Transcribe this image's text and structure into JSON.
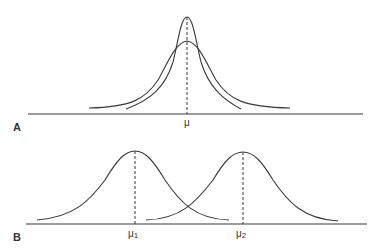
{
  "panels": {
    "A": {
      "label": "A",
      "mean_label": "μ",
      "description": "Two normal distributions with the same mean but different variances"
    },
    "B": {
      "label": "B",
      "mean1_label": "μ",
      "mean1_sub": "1",
      "mean2_label": "μ",
      "mean2_sub": "2",
      "description": "Two normal distributions with equal variance but different means"
    }
  },
  "colors": {
    "line": "#3a3a3a",
    "background": "#ffffff"
  }
}
